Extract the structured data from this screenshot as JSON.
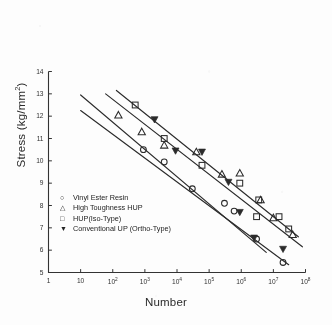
{
  "chart_data": {
    "type": "scatter",
    "title": "",
    "xlabel": "Number",
    "ylabel": "Stress (kg/mm²)",
    "ylabel_base": "Stress (kg/mm",
    "ylabel_sup": "2",
    "ylabel_tail": ")",
    "xscale": "log",
    "yscale": "linear",
    "xlim": [
      1,
      100000000
    ],
    "ylim": [
      5,
      14
    ],
    "grid": false,
    "legend_position": "lower-left-inside",
    "xticks": [
      {
        "value": 1,
        "mantissa": "1",
        "exp": ""
      },
      {
        "value": 10,
        "mantissa": "10",
        "exp": ""
      },
      {
        "value": 100,
        "mantissa": "10",
        "exp": "2"
      },
      {
        "value": 1000,
        "mantissa": "10",
        "exp": "3"
      },
      {
        "value": 10000,
        "mantissa": "10",
        "exp": "4"
      },
      {
        "value": 100000,
        "mantissa": "10",
        "exp": "5"
      },
      {
        "value": 1000000,
        "mantissa": "10",
        "exp": "6"
      },
      {
        "value": 10000000,
        "mantissa": "10",
        "exp": "7"
      },
      {
        "value": 100000000,
        "mantissa": "10",
        "exp": "8"
      }
    ],
    "yticks": [
      5,
      6,
      7,
      8,
      9,
      10,
      11,
      12,
      13,
      14
    ],
    "series": [
      {
        "name": "Vinyl Ester Resin",
        "marker": "circle-open",
        "line_style": "solid",
        "points": [
          {
            "x": 900,
            "y": 10.5
          },
          {
            "x": 4000,
            "y": 9.95
          },
          {
            "x": 30000,
            "y": 8.75
          },
          {
            "x": 300000,
            "y": 8.1
          },
          {
            "x": 600000,
            "y": 7.75
          },
          {
            "x": 3000000,
            "y": 6.5
          },
          {
            "x": 20000000,
            "y": 5.45
          }
        ],
        "fit_line": [
          {
            "x": 10,
            "y": 12.25
          },
          {
            "x": 30000000,
            "y": 5.35
          }
        ]
      },
      {
        "name": "High Toughness HUP",
        "marker": "triangle-open",
        "line_style": "solid",
        "points": [
          {
            "x": 150,
            "y": 12.05
          },
          {
            "x": 800,
            "y": 11.3
          },
          {
            "x": 4000,
            "y": 10.7
          },
          {
            "x": 40000,
            "y": 10.4
          },
          {
            "x": 250000,
            "y": 9.4
          },
          {
            "x": 900000,
            "y": 9.45
          },
          {
            "x": 4000000,
            "y": 8.25
          },
          {
            "x": 10000000,
            "y": 7.45
          },
          {
            "x": 40000000,
            "y": 6.7
          }
        ],
        "fit_line": [
          {
            "x": 60,
            "y": 13.0
          },
          {
            "x": 80000000,
            "y": 6.15
          }
        ]
      },
      {
        "name": "HUP(Iso-Type)",
        "marker": "square-open",
        "line_style": "solid",
        "points": [
          {
            "x": 500,
            "y": 12.5
          },
          {
            "x": 4000,
            "y": 11.0
          },
          {
            "x": 60000,
            "y": 9.8
          },
          {
            "x": 900000,
            "y": 9.0
          },
          {
            "x": 3500000,
            "y": 8.25
          },
          {
            "x": 3000000,
            "y": 7.5
          },
          {
            "x": 15000000,
            "y": 7.5
          },
          {
            "x": 30000000,
            "y": 6.95
          }
        ],
        "fit_line": [
          {
            "x": 130,
            "y": 13.15
          },
          {
            "x": 60000000,
            "y": 6.6
          }
        ]
      },
      {
        "name": "Conventional UP (Ortho-Type)",
        "marker": "triangle-down-filled",
        "line_style": "solid",
        "points": [
          {
            "x": 2000,
            "y": 11.85
          },
          {
            "x": 9000,
            "y": 10.45
          },
          {
            "x": 60000,
            "y": 10.4
          },
          {
            "x": 400000,
            "y": 9.05
          },
          {
            "x": 900000,
            "y": 7.7
          },
          {
            "x": 2500000,
            "y": 6.55
          },
          {
            "x": 20000000,
            "y": 6.05
          }
        ],
        "fit_line": [
          {
            "x": 10,
            "y": 12.95
          },
          {
            "x": 6000000,
            "y": 5.9
          }
        ]
      }
    ]
  },
  "legend": {
    "items": [
      {
        "marker": "○",
        "label": "Vinyl Ester Resin"
      },
      {
        "marker": "△",
        "label": "High Toughness HUP"
      },
      {
        "marker": "□",
        "label": "HUP(Iso-Type)"
      },
      {
        "marker": "▼",
        "label": "Conventional UP (Ortho-Type)"
      }
    ]
  },
  "colors": {
    "ink": "#2b2b2b",
    "axis": "#333333",
    "paper": "#fdfdfd"
  }
}
